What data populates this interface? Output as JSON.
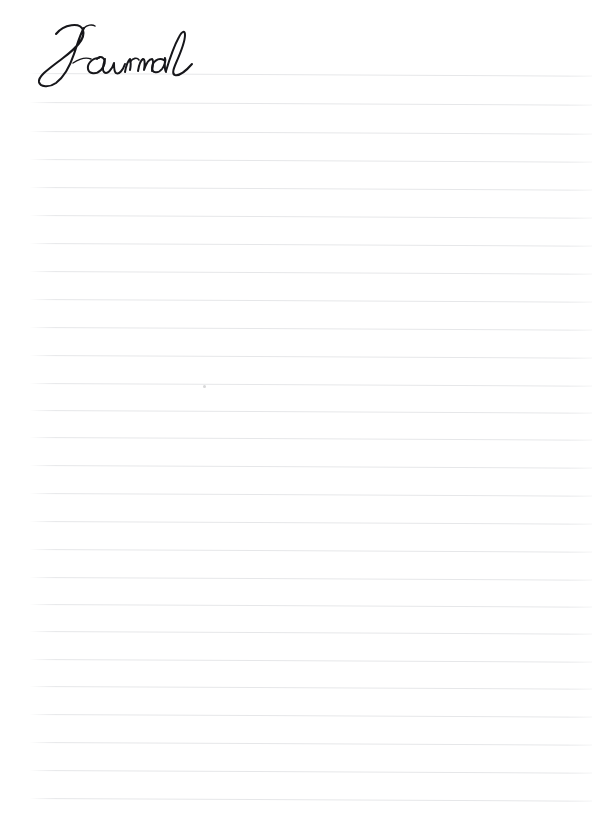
{
  "page": {
    "width": 616,
    "height": 830,
    "background_color": "#ffffff",
    "kind": "lined-journal-page",
    "paper_style": "ruled"
  },
  "title": {
    "text": "Journal",
    "style": "handwritten-script",
    "color": "#16161a",
    "position": "top-left",
    "left": 30,
    "top": 28,
    "width": 160,
    "height": 62
  },
  "rules": {
    "label": "writing-lines",
    "count": 26,
    "color": "#e6e7e9",
    "thickness": 1,
    "left": 30,
    "right": 592,
    "width": 562,
    "spacing": 28,
    "first_y": 73,
    "last_y": 798,
    "slant_deg": 0.28,
    "y_positions": [
      73,
      102,
      131,
      159,
      187,
      215,
      243,
      271,
      299,
      327,
      355,
      383,
      410,
      437,
      465,
      493,
      521,
      549,
      577,
      604,
      631,
      659,
      686,
      714,
      742,
      770,
      798
    ]
  },
  "artifacts": {
    "speck": {
      "name": "paper-speck",
      "x": 203,
      "y": 385,
      "size": 3,
      "color": "#c9c9cb"
    }
  },
  "content": {
    "body_text": "",
    "placeholder": "",
    "lines_written": 0
  }
}
